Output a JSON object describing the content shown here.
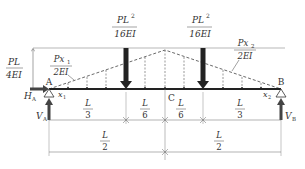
{
  "diagram": {
    "type": "simply-supported beam with conjugate loading (M/EI diagram)",
    "support_left": {
      "label": "A",
      "horizontal_reaction": "H",
      "horizontal_reaction_sub": "A",
      "vertical_reaction": "V",
      "vertical_reaction_sub": "A"
    },
    "support_right": {
      "label": "B",
      "vertical_reaction": "V",
      "vertical_reaction_sub": "B"
    },
    "midpoint": {
      "label": "C"
    },
    "loads": [
      {
        "num": "PL",
        "num_sup": "2",
        "den": "16EI"
      },
      {
        "num": "PL",
        "num_sup": "2",
        "den": "16EI"
      }
    ],
    "peak_ordinate": {
      "num": "PL",
      "den": "4EI"
    },
    "left_distributed": {
      "num": "Px",
      "num_sub": "1",
      "den": "2EI"
    },
    "right_distributed": {
      "num": "Px",
      "num_sub": "2",
      "den": "2EI"
    },
    "coords": {
      "x1": "x",
      "x1_sub": "1",
      "x2": "x",
      "x2_sub": "2"
    },
    "dimensions_row1": [
      {
        "num": "L",
        "den": "3"
      },
      {
        "num": "L",
        "den": "6"
      },
      {
        "num": "L",
        "den": "6"
      },
      {
        "num": "L",
        "den": "3"
      }
    ],
    "dimensions_row2": [
      {
        "num": "L",
        "den": "2"
      },
      {
        "num": "L",
        "den": "2"
      }
    ]
  }
}
